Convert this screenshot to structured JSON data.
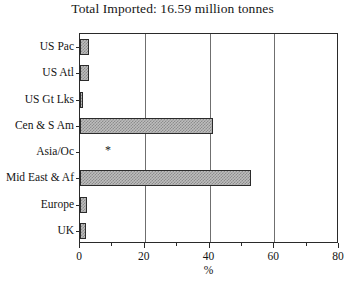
{
  "chart_data": {
    "type": "bar",
    "orientation": "horizontal",
    "title": "Total Imported: 16.59 million tonnes",
    "xlabel": "%",
    "ylabel": "",
    "xlim": [
      0,
      80
    ],
    "xticks": [
      0,
      20,
      40,
      60,
      80
    ],
    "xtick_labels": [
      "0",
      "20",
      "40",
      "60",
      "80"
    ],
    "xminor_ticks": [
      10,
      30,
      50,
      70
    ],
    "grid": "vertical-only",
    "legend": "none",
    "categories": [
      "US Pac",
      "US Atl",
      "US Gt Lks",
      "Cen & S Am",
      "Asia/Oc",
      "Mid East & Af",
      "Europe",
      "UK"
    ],
    "values": [
      2.8,
      2.8,
      1.0,
      41.0,
      0,
      52.8,
      2.2,
      1.8
    ],
    "annotations": [
      {
        "category": "Asia/Oc",
        "text": "*",
        "x": 8
      }
    ],
    "bar_face_color": "#bdbdbd",
    "bar_edge_color": "#2b2b2b",
    "bar_hatch": "checkerboard",
    "background_color": "#ffffff",
    "axis_color": "#2a2a2a"
  }
}
